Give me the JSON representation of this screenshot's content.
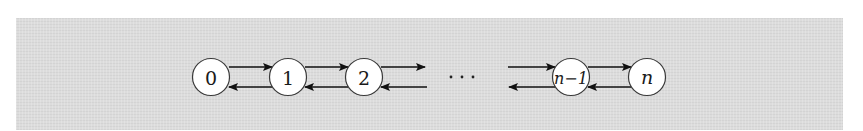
{
  "diagram": {
    "type": "birth-death chain",
    "background_color": "#dcdcdc",
    "nodes": [
      {
        "id": "0",
        "label": "0",
        "cx": 211,
        "cy": 77,
        "italic": false
      },
      {
        "id": "1",
        "label": "1",
        "cx": 288,
        "cy": 77,
        "italic": false
      },
      {
        "id": "2",
        "label": "2",
        "cx": 364,
        "cy": 77,
        "italic": false
      },
      {
        "id": "n-1",
        "label": "n−1",
        "cx": 571,
        "cy": 77,
        "italic": true
      },
      {
        "id": "n",
        "label": "n",
        "cx": 647,
        "cy": 77,
        "italic": true
      }
    ],
    "ellipsis": "···",
    "edges": [
      {
        "from": "0",
        "to": "1",
        "direction": "forward"
      },
      {
        "from": "1",
        "to": "0",
        "direction": "backward"
      },
      {
        "from": "1",
        "to": "2",
        "direction": "forward"
      },
      {
        "from": "2",
        "to": "1",
        "direction": "backward"
      },
      {
        "from": "2",
        "to": "...",
        "direction": "forward"
      },
      {
        "from": "...",
        "to": "2",
        "direction": "backward"
      },
      {
        "from": "...",
        "to": "n-1",
        "direction": "forward"
      },
      {
        "from": "n-1",
        "to": "...",
        "direction": "backward"
      },
      {
        "from": "n-1",
        "to": "n",
        "direction": "forward"
      },
      {
        "from": "n",
        "to": "n-1",
        "direction": "backward"
      }
    ]
  }
}
